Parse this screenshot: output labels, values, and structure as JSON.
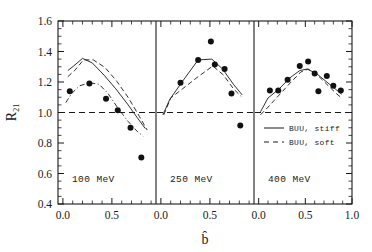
{
  "chart_data": {
    "type": "scatter",
    "title": "",
    "xlabel": "b̂",
    "ylabel": "R21",
    "ylim": [
      0.4,
      1.6
    ],
    "ytick_labels": [
      "0.4",
      "0.6",
      "0.8",
      "1.0",
      "1.2",
      "1.4",
      "1.6"
    ],
    "ytick_values": [
      0.4,
      0.6,
      0.8,
      1.0,
      1.2,
      1.4,
      1.6
    ],
    "grid": false,
    "reference_line": {
      "y": 1.0,
      "style": "dashed"
    },
    "legend": {
      "position": "panel-3 upper-middle",
      "entries": [
        {
          "label": "BUU, stiff",
          "style": "solid"
        },
        {
          "label": "BUU, soft",
          "style": "dashed"
        }
      ]
    },
    "panels": [
      {
        "label": "100 MeV",
        "xlim": [
          -0.05,
          0.95
        ],
        "xtick_labels": [
          "0.0",
          "0.5"
        ],
        "xtick_values": [
          0.0,
          0.5
        ],
        "points": {
          "x": [
            0.07,
            0.27,
            0.44,
            0.56,
            0.69,
            0.8
          ],
          "y": [
            1.14,
            1.19,
            1.09,
            1.015,
            0.9,
            0.705
          ]
        },
        "series": [
          {
            "name": "BUU, stiff",
            "style": "solid",
            "x": [
              0.05,
              0.11,
              0.2,
              0.3,
              0.42,
              0.54,
              0.66,
              0.76,
              0.84
            ],
            "y": [
              1.275,
              1.305,
              1.355,
              1.325,
              1.245,
              1.155,
              1.055,
              0.965,
              0.895
            ]
          },
          {
            "name": "BUU, soft",
            "style": "dashed",
            "x": [
              0.05,
              0.12,
              0.21,
              0.31,
              0.43,
              0.55,
              0.67,
              0.78,
              0.86
            ],
            "y": [
              1.235,
              1.275,
              1.345,
              1.345,
              1.295,
              1.205,
              1.095,
              0.975,
              0.885
            ]
          },
          {
            "name": "data-guide-dashdot",
            "style": "dashdot",
            "x": [
              0.03,
              0.09,
              0.17,
              0.27,
              0.37,
              0.46,
              0.56,
              0.66,
              0.76,
              0.82
            ],
            "y": [
              1.065,
              1.125,
              1.175,
              1.195,
              1.185,
              1.125,
              1.03,
              0.945,
              0.875,
              0.845
            ]
          }
        ]
      },
      {
        "label": "250 MeV",
        "xlim": [
          -0.05,
          0.95
        ],
        "xtick_labels": [
          "0.0",
          "0.5"
        ],
        "xtick_values": [
          0.0,
          0.5
        ],
        "points": {
          "x": [
            0.2,
            0.38,
            0.51,
            0.55,
            0.65,
            0.72,
            0.81
          ],
          "y": [
            1.195,
            1.345,
            1.465,
            1.315,
            1.285,
            1.125,
            0.915
          ]
        },
        "series": [
          {
            "name": "BUU, stiff",
            "style": "solid",
            "x": [
              0.02,
              0.09,
              0.21,
              0.38,
              0.52,
              0.63,
              0.74,
              0.83
            ],
            "y": [
              0.985,
              1.085,
              1.195,
              1.345,
              1.35,
              1.285,
              1.185,
              1.115
            ]
          },
          {
            "name": "BUU, soft",
            "style": "dashed",
            "x": [
              0.03,
              0.1,
              0.22,
              0.38,
              0.53,
              0.64,
              0.74,
              0.82
            ],
            "y": [
              0.985,
              1.095,
              1.155,
              1.235,
              1.305,
              1.245,
              1.155,
              1.105
            ]
          }
        ]
      },
      {
        "label": "400 MeV",
        "xlim": [
          -0.05,
          1.0
        ],
        "xtick_labels": [
          "0.0",
          "0.5",
          "1.0"
        ],
        "xtick_values": [
          0.0,
          0.5,
          1.0
        ],
        "points": {
          "x": [
            0.12,
            0.21,
            0.31,
            0.44,
            0.53,
            0.6,
            0.64,
            0.73,
            0.8,
            0.88
          ],
          "y": [
            1.145,
            1.145,
            1.215,
            1.305,
            1.335,
            1.255,
            1.14,
            1.24,
            1.175,
            1.145
          ]
        },
        "series": [
          {
            "name": "BUU, stiff",
            "style": "solid",
            "x": [
              0.02,
              0.1,
              0.22,
              0.33,
              0.44,
              0.52,
              0.62,
              0.72,
              0.82,
              0.89
            ],
            "y": [
              1.005,
              1.095,
              1.155,
              1.225,
              1.275,
              1.285,
              1.255,
              1.205,
              1.155,
              1.12
            ]
          },
          {
            "name": "BUU, soft",
            "style": "dashed",
            "x": [
              0.02,
              0.1,
              0.22,
              0.34,
              0.45,
              0.53,
              0.63,
              0.73,
              0.83,
              0.89
            ],
            "y": [
              0.985,
              1.035,
              1.115,
              1.195,
              1.265,
              1.285,
              1.245,
              1.185,
              1.125,
              1.095
            ]
          }
        ]
      }
    ]
  }
}
